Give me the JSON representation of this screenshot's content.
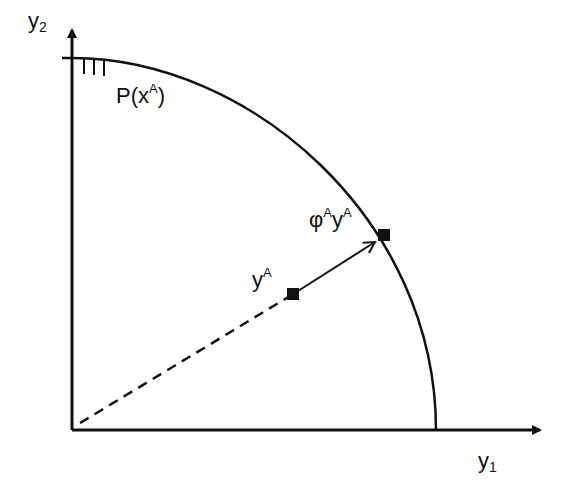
{
  "diagram": {
    "axes": {
      "x_label_base": "y",
      "x_label_sub": "1",
      "y_label_base": "y",
      "y_label_sub": "2"
    },
    "frontier": {
      "label_base": "P(x",
      "label_sup": "A",
      "label_close": ")"
    },
    "points": {
      "observed": {
        "base": "y",
        "sup": "A"
      },
      "projected": {
        "phi": "φ",
        "phi_sup": "A",
        "base": "y",
        "sup": "A"
      }
    },
    "colors": {
      "ink": "#111111",
      "background": "#ffffff"
    }
  }
}
